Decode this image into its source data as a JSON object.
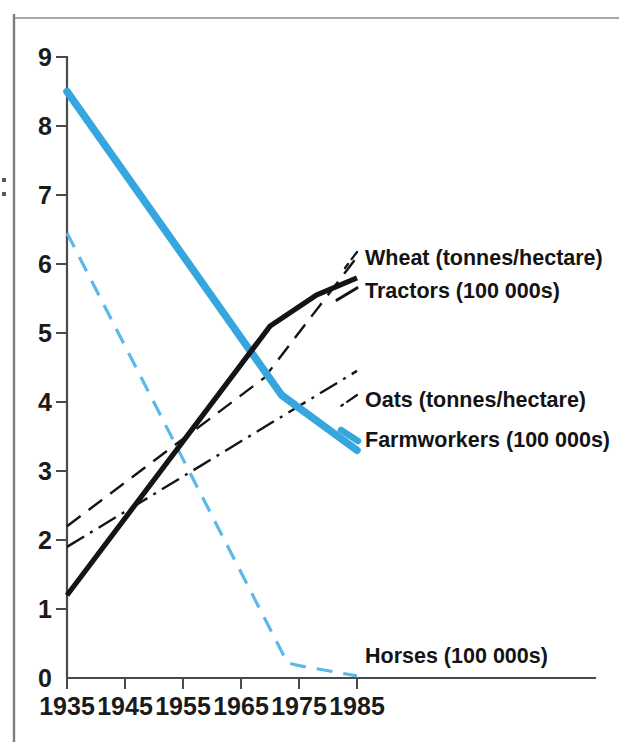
{
  "chart_data": {
    "type": "line",
    "title": "",
    "xlabel": "",
    "ylabel": "",
    "xlim": [
      1935,
      1988
    ],
    "ylim": [
      0,
      9
    ],
    "grid": false,
    "legend_position": "inline-right-of-line-ends",
    "xticks": [
      "1935",
      "1945",
      "1955",
      "1965",
      "1975",
      "1985"
    ],
    "xtick_values": [
      1935,
      1945,
      1955,
      1965,
      1975,
      1985
    ],
    "yticks": [
      "0",
      "1",
      "2",
      "3",
      "4",
      "5",
      "6",
      "7",
      "8",
      "9"
    ],
    "ytick_values": [
      0,
      1,
      2,
      3,
      4,
      5,
      6,
      7,
      8,
      9
    ],
    "series": [
      {
        "name": "Farmworkers (100 000s)",
        "style": "solid-thick",
        "color": "#36a6de",
        "x": [
          1935,
          1972,
          1985
        ],
        "values": [
          8.5,
          4.1,
          3.3
        ]
      },
      {
        "name": "Horses (100 000s)",
        "style": "dashed",
        "color": "#5bb8e8",
        "x": [
          1935,
          1973,
          1975,
          1985
        ],
        "values": [
          6.45,
          0.22,
          0.18,
          0.03
        ]
      },
      {
        "name": "Tractors (100 000s)",
        "style": "solid-thick",
        "color": "#141414",
        "x": [
          1935,
          1970,
          1978,
          1985
        ],
        "values": [
          1.2,
          5.1,
          5.55,
          5.8
        ]
      },
      {
        "name": "Wheat (tonnes/hectare)",
        "style": "dashed",
        "color": "#141414",
        "x": [
          1935,
          1969,
          1985
        ],
        "values": [
          2.2,
          4.35,
          6.1
        ]
      },
      {
        "name": "Oats (tonnes/hectare)",
        "style": "dash-dot",
        "color": "#141414",
        "x": [
          1935,
          1985
        ],
        "values": [
          1.9,
          4.45
        ]
      }
    ],
    "labels": [
      {
        "text": "Wheat (tonnes/hectare)",
        "series": "Wheat (tonnes/hectare)"
      },
      {
        "text": "Tractors (100 000s)",
        "series": "Tractors (100 000s)"
      },
      {
        "text": "Oats (tonnes/hectare)",
        "series": "Oats (tonnes/hectare)"
      },
      {
        "text": "Farmworkers (100 000s)",
        "series": "Farmworkers (100 000s)"
      },
      {
        "text": "Horses (100 000s)",
        "series": "Horses (100 000s)"
      }
    ]
  },
  "axes": {
    "y_tick_0": "0",
    "y_tick_1": "1",
    "y_tick_2": "2",
    "y_tick_3": "3",
    "y_tick_4": "4",
    "y_tick_5": "5",
    "y_tick_6": "6",
    "y_tick_7": "7",
    "y_tick_8": "8",
    "y_tick_9": "9",
    "x_tick_0": "1935",
    "x_tick_1": "1945",
    "x_tick_2": "1955",
    "x_tick_3": "1965",
    "x_tick_4": "1975",
    "x_tick_5": "1985"
  },
  "legend": {
    "wheat": "Wheat (tonnes/hectare)",
    "tractors": "Tractors (100 000s)",
    "oats": "Oats (tonnes/hectare)",
    "farmworkers": "Farmworkers (100 000s)",
    "horses": "Horses (100 000s)"
  },
  "colors": {
    "blue": "#36a6de",
    "blue_light": "#5bb8e8",
    "black": "#141414",
    "axis": "#4a4a4a",
    "frame": "#8c8c8c"
  }
}
